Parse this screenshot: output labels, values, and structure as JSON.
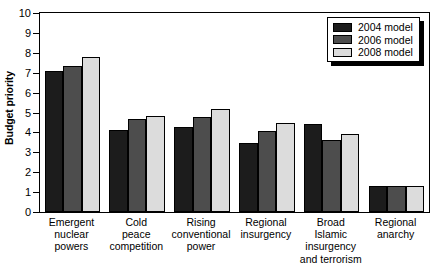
{
  "chart_data": {
    "type": "bar",
    "title": "",
    "xlabel": "",
    "ylabel": "Budget priority",
    "ylim": [
      0,
      10
    ],
    "ytick_labels": [
      "0",
      "1",
      "2",
      "3",
      "4",
      "5",
      "6",
      "7",
      "8",
      "9",
      "10"
    ],
    "grid": false,
    "legend_position": "top-right",
    "categories": [
      "Emergent nuclear powers",
      "Cold peace competition",
      "Rising conventional power",
      "Regional insurgency",
      "Broad Islamic insurgency and terrorism",
      "Regional anarchy"
    ],
    "category_lines": [
      [
        "Emergent",
        "nuclear",
        "powers"
      ],
      [
        "Cold",
        "peace",
        "competition"
      ],
      [
        "Rising",
        "conventional",
        "power"
      ],
      [
        "Regional",
        "insurgency"
      ],
      [
        "Broad",
        "Islamic",
        "insurgency",
        "and terrorism"
      ],
      [
        "Regional",
        "anarchy"
      ]
    ],
    "series": [
      {
        "name": "2004 model",
        "color": "#1c1c1c",
        "values": [
          7.1,
          4.1,
          4.25,
          3.45,
          4.4,
          1.3
        ]
      },
      {
        "name": "2006 model",
        "color": "#4d4d4d",
        "values": [
          7.35,
          4.65,
          4.75,
          4.05,
          3.6,
          1.3
        ]
      },
      {
        "name": "2008 model",
        "color": "#dcdcdc",
        "values": [
          7.8,
          4.85,
          5.2,
          4.45,
          3.9,
          1.3
        ]
      }
    ]
  }
}
